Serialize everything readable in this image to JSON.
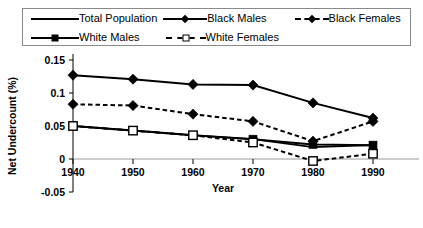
{
  "legend": {
    "entries": [
      {
        "label": "Total Population",
        "style": "solid",
        "marker": "none"
      },
      {
        "label": "Black Males",
        "style": "solid",
        "marker": "diamond-filled"
      },
      {
        "label": "Black Females",
        "style": "dashed",
        "marker": "diamond-filled"
      },
      {
        "label": "White Males",
        "style": "solid",
        "marker": "square-filled"
      },
      {
        "label": "White Females",
        "style": "dashed",
        "marker": "square-open"
      }
    ]
  },
  "chart_data": {
    "type": "line",
    "title": "",
    "xlabel": "Year",
    "ylabel": "Net Undercount (%)",
    "categories": [
      1940,
      1950,
      1960,
      1970,
      1980,
      1990
    ],
    "xtick_labels": [
      "1940",
      "1950",
      "1960",
      "1970",
      "1980",
      "1990"
    ],
    "ytick_labels": [
      "0.15",
      "0.1",
      "0.05",
      "0",
      "-0.05"
    ],
    "ytick_values": [
      0.15,
      0.1,
      0.05,
      0,
      -0.05
    ],
    "ylim": [
      -0.05,
      0.15
    ],
    "xlim": [
      1940,
      1990
    ],
    "grid": false,
    "zero_line": true,
    "legend_position": "top",
    "series": [
      {
        "name": "Total Population",
        "style": "solid",
        "marker": "none",
        "values": [
          0.05,
          0.043,
          0.036,
          0.03,
          0.018,
          0.021
        ]
      },
      {
        "name": "Black Males",
        "style": "solid",
        "marker": "diamond-filled",
        "values": [
          0.127,
          0.121,
          0.113,
          0.112,
          0.085,
          0.062
        ]
      },
      {
        "name": "Black Females",
        "style": "dashed",
        "marker": "diamond-filled",
        "values": [
          0.083,
          0.081,
          0.068,
          0.057,
          0.027,
          0.057
        ]
      },
      {
        "name": "White Males",
        "style": "solid",
        "marker": "square-filled",
        "values": [
          0.05,
          0.043,
          0.036,
          0.03,
          0.022,
          0.021
        ]
      },
      {
        "name": "White Females",
        "style": "dashed",
        "marker": "square-open",
        "values": [
          0.05,
          0.043,
          0.036,
          0.025,
          -0.003,
          0.008
        ]
      }
    ],
    "colors": {
      "ink": "#000000",
      "zero_line": "#9a9a9a",
      "frame": "#8a8a8a",
      "background": "#ffffff"
    }
  }
}
